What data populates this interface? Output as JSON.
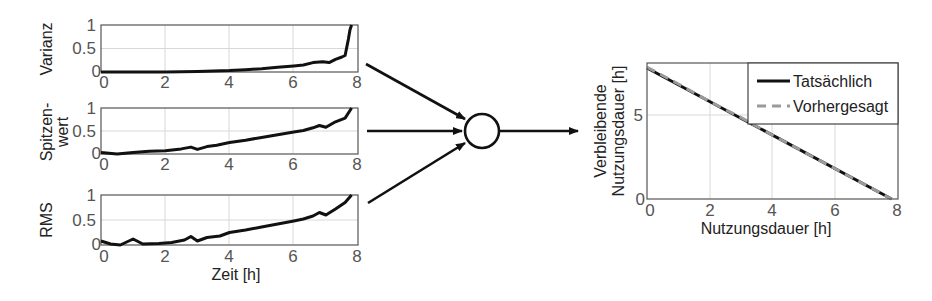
{
  "diagram": {
    "node": {
      "shape": "circle",
      "label": ""
    },
    "arrows": [
      {
        "from": "Varianz",
        "to": "node"
      },
      {
        "from": "Spitzenwert",
        "to": "node"
      },
      {
        "from": "RMS",
        "to": "node"
      },
      {
        "from": "node",
        "to": "rul-chart"
      }
    ]
  },
  "chart_data": [
    {
      "id": "varianz",
      "type": "line",
      "title": "",
      "ylabel": "Varianz",
      "xlabel": "",
      "xlim": [
        0,
        8
      ],
      "ylim": [
        0,
        1
      ],
      "xticks": [
        "0",
        "2",
        "4",
        "6",
        "8"
      ],
      "yticks": [
        "0",
        "0.5",
        "1"
      ],
      "grid": true,
      "series": [
        {
          "name": "Varianz",
          "x": [
            0,
            1,
            2,
            3,
            4,
            4.5,
            5,
            5.5,
            6,
            6.3,
            6.6,
            6.9,
            7.1,
            7.3,
            7.5,
            7.6,
            7.7,
            7.75,
            7.8
          ],
          "y": [
            0,
            0,
            0,
            0.01,
            0.03,
            0.05,
            0.07,
            0.1,
            0.13,
            0.15,
            0.2,
            0.22,
            0.2,
            0.27,
            0.32,
            0.35,
            0.7,
            0.9,
            1.0
          ]
        }
      ]
    },
    {
      "id": "spitzenwert",
      "type": "line",
      "title": "",
      "ylabel": "Spitzen-wert",
      "xlabel": "",
      "xlim": [
        0,
        8
      ],
      "ylim": [
        0,
        1
      ],
      "xticks": [
        "0",
        "2",
        "4",
        "6",
        "8"
      ],
      "yticks": [
        "0",
        "0.5",
        "1"
      ],
      "grid": true,
      "series": [
        {
          "name": "Spitzenwert",
          "x": [
            0,
            0.5,
            1,
            1.5,
            2,
            2.5,
            2.8,
            3,
            3.3,
            3.6,
            4,
            4.5,
            5,
            5.5,
            6,
            6.3,
            6.6,
            6.8,
            7,
            7.3,
            7.6,
            7.8
          ],
          "y": [
            0.03,
            0,
            0.03,
            0.06,
            0.07,
            0.11,
            0.15,
            0.1,
            0.16,
            0.19,
            0.25,
            0.3,
            0.36,
            0.42,
            0.48,
            0.51,
            0.57,
            0.62,
            0.58,
            0.7,
            0.78,
            1.0
          ]
        }
      ]
    },
    {
      "id": "rms",
      "type": "line",
      "title": "",
      "ylabel": "RMS",
      "xlabel": "Zeit [h]",
      "xlim": [
        0,
        8
      ],
      "ylim": [
        0,
        1
      ],
      "xticks": [
        "0",
        "2",
        "4",
        "6",
        "8"
      ],
      "yticks": [
        "0",
        "0.5",
        "1"
      ],
      "grid": true,
      "series": [
        {
          "name": "RMS",
          "x": [
            0,
            0.3,
            0.6,
            1.0,
            1.3,
            1.8,
            2.2,
            2.6,
            2.8,
            3.0,
            3.3,
            3.7,
            4.0,
            4.5,
            5.0,
            5.5,
            6.0,
            6.3,
            6.6,
            6.8,
            7.0,
            7.3,
            7.6,
            7.8
          ],
          "y": [
            0.08,
            0.02,
            0.0,
            0.12,
            0.02,
            0.03,
            0.05,
            0.1,
            0.17,
            0.08,
            0.15,
            0.18,
            0.25,
            0.3,
            0.36,
            0.42,
            0.48,
            0.52,
            0.58,
            0.65,
            0.6,
            0.72,
            0.85,
            1.0
          ]
        }
      ]
    },
    {
      "id": "rul",
      "type": "line",
      "title": "",
      "ylabel": "Verbleibende Nutzungsdauer [h]",
      "ylabel_lines": [
        "Verbleibende",
        "Nutzungsdauer [h]"
      ],
      "xlabel": "Nutzungsdauer [h]",
      "xlim": [
        0,
        8
      ],
      "ylim": [
        0,
        8.1
      ],
      "xticks": [
        "0",
        "2",
        "4",
        "6",
        "8"
      ],
      "yticks": [
        "0",
        "5"
      ],
      "grid": true,
      "legend_position": "upper right",
      "series": [
        {
          "name": "Tatsächlich",
          "style": "solid",
          "color": "#111111",
          "x": [
            0,
            7.8
          ],
          "y": [
            7.8,
            0
          ]
        },
        {
          "name": "Vorhergesagt",
          "style": "dashed",
          "color": "#9a9a9a",
          "x": [
            0,
            1,
            2,
            3,
            4,
            5,
            6,
            7,
            7.8
          ],
          "y": [
            7.85,
            6.85,
            5.8,
            4.85,
            3.8,
            2.8,
            1.8,
            0.8,
            0
          ]
        }
      ]
    }
  ],
  "labels": {
    "varianz": "Varianz",
    "spitzen_line1": "Spitzen-",
    "spitzen_line2": "wert",
    "rms": "RMS",
    "zeit": "Zeit [h]",
    "rul_y1": "Verbleibende",
    "rul_y2": "Nutzungsdauer [h]",
    "rul_x": "Nutzungsdauer [h]",
    "legend_actual": "Tatsächlich",
    "legend_predicted": "Vorhergesagt",
    "ticks": {
      "t0": "0",
      "t2": "2",
      "t4": "4",
      "t6": "6",
      "t8": "8",
      "y0": "0",
      "y05": "0.5",
      "y1": "1",
      "y5": "5"
    }
  }
}
